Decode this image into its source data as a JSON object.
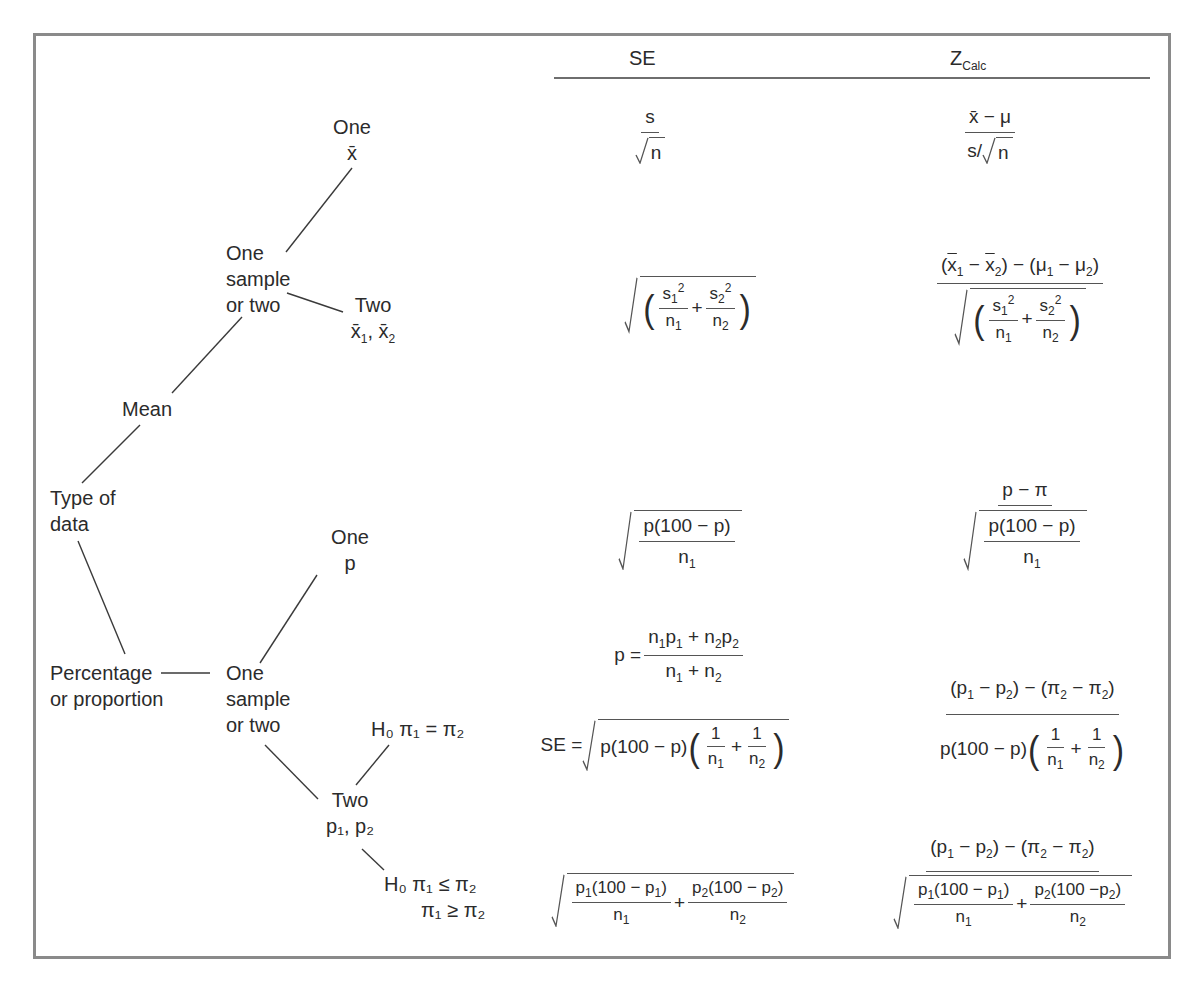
{
  "diagram": {
    "columns": {
      "se_header": "SE",
      "z_header_main": "Z",
      "z_header_sub": "Calc"
    },
    "tree": {
      "root": "Type of data",
      "root_line1": "Type of",
      "root_line2": "data",
      "mean": "Mean",
      "mean_choice_line1": "One",
      "mean_choice_line2": "sample",
      "mean_choice_line3": "or two",
      "mean_one_line1": "One",
      "mean_one_line2": "x̄",
      "mean_two_line1": "Two",
      "mean_two_line2_a": "x̄",
      "mean_two_line2_b": "1",
      "mean_two_line2_c": ", x̄",
      "mean_two_line2_d": "2",
      "prop_line1": "Percentage",
      "prop_line2": "or proportion",
      "prop_choice_line1": "One",
      "prop_choice_line2": "sample",
      "prop_choice_line3": "or two",
      "prop_one_line1": "One",
      "prop_one_line2": "p",
      "prop_two_line1": "Two",
      "prop_two_line2": "p₁, p₂",
      "h0_equal": "H₀  π₁ = π₂",
      "h0_ineq_line1": "H₀  π₁ ≤ π₂",
      "h0_ineq_line2": "π₁ ≥ π₂"
    },
    "rows": [
      {
        "case": "One mean",
        "se": "s / √n",
        "z": "(x̄ − μ) / (s/√n)"
      },
      {
        "case": "Two means",
        "se": "√( s₁²/n₁ + s₂²/n₂ )",
        "z": "((x̄₁ − x̄₂) − (μ₁ − μ₂)) / √( s₁²/n₁ + s₂²/n₂ )"
      },
      {
        "case": "One proportion",
        "se": "√( p(100 − p) / n₁ )",
        "z": "(p − π) / √( p(100 − p) / n₁ )"
      },
      {
        "case": "Two proportions, H0 π1 = π2",
        "pooled": "p = (n₁p₁ + n₂p₂) / (n₁ + n₂)",
        "se": "SE = √( p(100 − p)(1/n₁ + 1/n₂) )",
        "z": "((p₁ − p₂) − (π₂ − π₂)) / p(100 − p)(1/n₁ + 1/n₂)"
      },
      {
        "case": "Two proportions, H0 π1 ≤ π2 / π1 ≥ π2",
        "se": "√( p₁(100 − p₁)/n₁ + p₂(100 − p₂)/n₂ )",
        "z": "((p₁ − p₂) − (π₂ − π₂)) / √( p₁(100 − p₁)/n₁ + p₂(100 −p₂)/n₂ )"
      }
    ],
    "math": {
      "s": "s",
      "n": "n",
      "mu": "μ",
      "xbar": "x̄",
      "minus": "−",
      "plus": "+",
      "eq": "=",
      "slash": "/",
      "p": "p",
      "pi": "π",
      "one": "1",
      "two": "2",
      "se_eq": "SE =",
      "p100p": "p(100 − p)",
      "n1": "n",
      "p1_100_p1": "(100 − p",
      "p2_100_p2": "(100 − p",
      "p2_100_p2_tight": "(100 −p"
    },
    "colors": {
      "frame": "#8a8a8a",
      "text": "#2b2b2b",
      "rule": "#6e6e6e"
    }
  }
}
